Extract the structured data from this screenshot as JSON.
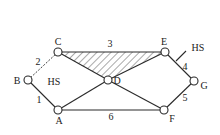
{
  "diagram": {
    "type": "graph",
    "colors": {
      "stroke": "#2a2a2a",
      "background": "#ffffff",
      "hatch": "#2a2a2a"
    },
    "nodes": [
      {
        "id": "A",
        "label": "A",
        "x": 58,
        "y": 110
      },
      {
        "id": "B",
        "label": "B",
        "x": 28,
        "y": 80
      },
      {
        "id": "C",
        "label": "C",
        "x": 58,
        "y": 52
      },
      {
        "id": "D",
        "label": "D",
        "x": 108,
        "y": 80
      },
      {
        "id": "E",
        "label": "E",
        "x": 165,
        "y": 52
      },
      {
        "id": "F",
        "label": "F",
        "x": 164,
        "y": 110
      },
      {
        "id": "G",
        "label": "G",
        "x": 194,
        "y": 81
      }
    ],
    "edges": [
      {
        "from": "B",
        "to": "A",
        "label": "1",
        "style": "solid"
      },
      {
        "from": "B",
        "to": "C",
        "label": "2",
        "style": "dashed"
      },
      {
        "from": "C",
        "to": "E",
        "label": "3",
        "style": "solid"
      },
      {
        "from": "E",
        "to": "G",
        "label": "4",
        "style": "solid"
      },
      {
        "from": "F",
        "to": "G",
        "label": "5",
        "style": "solid"
      },
      {
        "from": "A",
        "to": "F",
        "label": "6",
        "style": "solid"
      },
      {
        "from": "C",
        "to": "D",
        "label": "",
        "style": "solid"
      },
      {
        "from": "D",
        "to": "E",
        "label": "",
        "style": "solid"
      },
      {
        "from": "A",
        "to": "D",
        "label": "",
        "style": "solid"
      },
      {
        "from": "D",
        "to": "F",
        "label": "",
        "style": "solid"
      }
    ],
    "hatched_region": {
      "vertices": [
        "C",
        "E",
        "D"
      ]
    },
    "annotations": [
      {
        "id": "hs-left",
        "text": "HS"
      },
      {
        "id": "hs-right",
        "text": "HS"
      }
    ]
  }
}
